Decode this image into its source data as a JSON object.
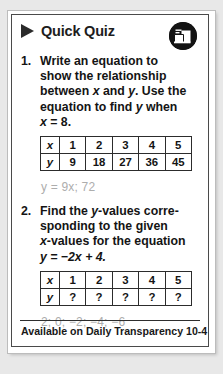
{
  "header": {
    "title": "Quick Quiz",
    "triangle_icon": "play-triangle-icon",
    "corner_icon": "folder-document-icon",
    "icon_bg_color": "#131313"
  },
  "questions": [
    {
      "number": "1.",
      "line1": "Write an equation to",
      "line2": "show the relationship",
      "line3_a": "between ",
      "line3_x": "x",
      "line3_b": " and ",
      "line3_y": "y",
      "line3_c": ". Use the",
      "line4_a": "equation to find ",
      "line4_y": "y",
      "line4_b": " when",
      "line5_x": "x",
      "line5_b": " = 8.",
      "answer": "y = 9x; 72"
    },
    {
      "number": "2.",
      "line1_a": "Find the ",
      "line1_y": "y",
      "line1_b": "-values corre-",
      "line2": "sponding to the given",
      "line3_x": "x",
      "line3_b": "-values for the equation",
      "line4": "y = −2x + 4.",
      "answer": "2; 0; −2; −4; −6"
    }
  ],
  "table1": {
    "row_labels": [
      "x",
      "y"
    ],
    "x_values": [
      "1",
      "2",
      "3",
      "4",
      "5"
    ],
    "y_values": [
      "9",
      "18",
      "27",
      "36",
      "45"
    ]
  },
  "table2": {
    "row_labels": [
      "x",
      "y"
    ],
    "x_values": [
      "1",
      "2",
      "3",
      "4",
      "5"
    ],
    "y_values": [
      "?",
      "?",
      "?",
      "?",
      "?"
    ]
  },
  "footer": {
    "text": "Available on Daily Transparency 10-4"
  },
  "colors": {
    "text": "#141414",
    "answer_gray": "#adadad",
    "border": "#4a4a4a",
    "page_bg": "#e8e8e8"
  }
}
